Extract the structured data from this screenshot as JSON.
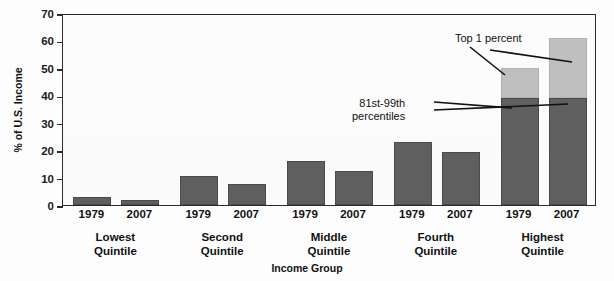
{
  "chart_data": {
    "type": "bar",
    "title": "",
    "xlabel": "Income Group",
    "ylabel": "% of U.S. Income",
    "ylim": [
      0,
      70
    ],
    "ytick_step": 10,
    "yticks": [
      0,
      10,
      20,
      30,
      40,
      50,
      60,
      70
    ],
    "grid": false,
    "legend": "none",
    "stacked_group": "Highest Quintile",
    "categories": [
      "Lowest Quintile",
      "Second Quintile",
      "Middle Quintile",
      "Fourth Quintile",
      "Highest Quintile"
    ],
    "years": [
      "1979",
      "2007"
    ],
    "series": [
      {
        "name": "1979",
        "values": [
          3,
          10.5,
          16,
          23,
          50
        ]
      },
      {
        "name": "2007",
        "values": [
          2,
          7.5,
          12.5,
          19.5,
          61
        ]
      }
    ],
    "highest_quintile_breakdown": {
      "1979": {
        "81st-99th percentiles": 39,
        "Top 1 percent": 11,
        "total": 50
      },
      "2007": {
        "81st-99th percentiles": 39,
        "Top 1 percent": 22,
        "total": 61
      }
    },
    "annotations": [
      {
        "text": "Top 1 percent",
        "points_to": "light-gray upper bar segments"
      },
      {
        "text": "81st-99th percentiles",
        "points_to": "dark gray lower bar segments"
      }
    ],
    "colors": {
      "lower_segment": "#5f5f5f",
      "upper_segment": "#bfbfbf",
      "axis": "#2b2b2b",
      "text": "#111111",
      "background": "#fdfdfd"
    }
  },
  "axis": {
    "y_label": "% of U.S. Income",
    "x_label": "Income Group",
    "y_ticks": [
      "70",
      "60",
      "50",
      "40",
      "30",
      "20",
      "10",
      "0"
    ]
  },
  "groups": [
    {
      "label_line1": "Lowest",
      "label_line2": "Quintile",
      "bars": [
        {
          "year": "1979",
          "lower": 3,
          "upper": 0
        },
        {
          "year": "2007",
          "lower": 2,
          "upper": 0
        }
      ]
    },
    {
      "label_line1": "Second",
      "label_line2": "Quintile",
      "bars": [
        {
          "year": "1979",
          "lower": 10.5,
          "upper": 0
        },
        {
          "year": "2007",
          "lower": 7.5,
          "upper": 0
        }
      ]
    },
    {
      "label_line1": "Middle",
      "label_line2": "Quintile",
      "bars": [
        {
          "year": "1979",
          "lower": 16,
          "upper": 0
        },
        {
          "year": "2007",
          "lower": 12.5,
          "upper": 0
        }
      ]
    },
    {
      "label_line1": "Fourth",
      "label_line2": "Quintile",
      "bars": [
        {
          "year": "1979",
          "lower": 23,
          "upper": 0
        },
        {
          "year": "2007",
          "lower": 19.5,
          "upper": 0
        }
      ]
    },
    {
      "label_line1": "Highest",
      "label_line2": "Quintile",
      "bars": [
        {
          "year": "1979",
          "lower": 39,
          "upper": 11
        },
        {
          "year": "2007",
          "lower": 39,
          "upper": 22
        }
      ]
    }
  ],
  "annotations": {
    "top1": "Top 1 percent",
    "pct_line1": "81st-99th",
    "pct_line2": "percentiles"
  }
}
